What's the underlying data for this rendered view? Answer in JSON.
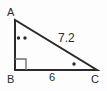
{
  "figure": {
    "type": "right-triangle-diagram",
    "background_color": "#fdfdfd",
    "stroke_color": "#2b2b2b",
    "text_color": "#2b2b2b"
  },
  "vertices": {
    "a": {
      "label": "A",
      "x": 15,
      "y": 20
    },
    "b": {
      "label": "B",
      "x": 15,
      "y": 70
    },
    "c": {
      "label": "C",
      "x": 97,
      "y": 70
    }
  },
  "sides": {
    "hypotenuse": {
      "label": "7.2",
      "from": "A",
      "to": "C"
    },
    "base": {
      "label": "6",
      "from": "B",
      "to": "C"
    },
    "vertical": {
      "label": "",
      "from": "A",
      "to": "B"
    }
  },
  "marks": {
    "right_angle": {
      "name": "right-angle-mark",
      "at": "B"
    },
    "angle_a": {
      "name": "double-dot-angle-mark",
      "at": "A",
      "dots": 2
    },
    "angle_c": {
      "name": "single-dot-angle-mark",
      "at": "C",
      "dots": 1
    }
  }
}
